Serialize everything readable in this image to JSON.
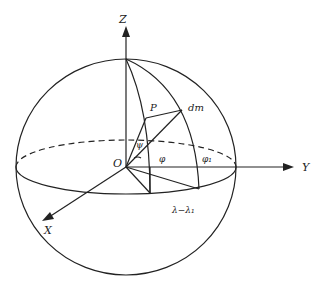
{
  "diagram": {
    "title": "",
    "labels": {
      "z_axis": "Z",
      "y_axis": "Y",
      "x_axis": "X",
      "origin": "O",
      "point_p": "P",
      "mass_element": "dm",
      "angle_psi": "ψ",
      "angle_phi": "φ",
      "angle_phi1": "φ₁",
      "longitude_diff": "λ−λ₁"
    },
    "colors": {
      "stroke": "#222222",
      "background": "#ffffff"
    }
  }
}
